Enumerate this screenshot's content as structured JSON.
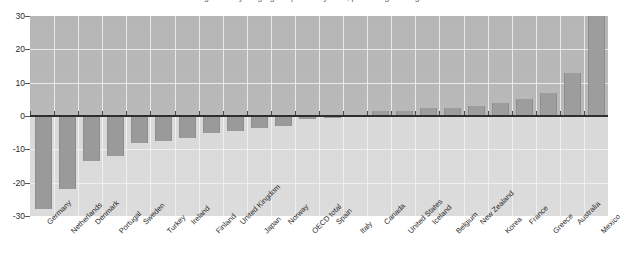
{
  "chart_data": {
    "type": "bar",
    "title": "Change in the young-age dependency ratio, percentage change",
    "xlabel": "",
    "ylabel": "",
    "ylim": [
      -30,
      30
    ],
    "yticks": [
      30,
      20,
      10,
      0,
      -10,
      -20,
      -30
    ],
    "ytick_labels": [
      "30",
      "20",
      "10",
      "0",
      "-10",
      "-20",
      "-30"
    ],
    "grid": true,
    "legend": "none",
    "series_name": "Percentage change",
    "bar_color": "#9a9a9a",
    "plot_background_above_zero": "#b8b8b8",
    "plot_background_below_zero": "#dadada",
    "categories": [
      "Germany",
      "Netherlands",
      "Denmark",
      "Portugal",
      "Sweden",
      "Turkey",
      "Ireland",
      "Finland",
      "United Kingdom",
      "Japan",
      "Norway",
      "OECD total",
      "Spain",
      "Italy",
      "Canada",
      "United States",
      "Iceland",
      "Belgium",
      "New Zealand",
      "Korea",
      "France",
      "Greece",
      "Australia",
      "Mexico"
    ],
    "values": [
      -28,
      -22,
      -13.5,
      -12,
      -8,
      -7.5,
      -6.5,
      -5,
      -4.5,
      -3.5,
      -3,
      -1,
      -0.5,
      -0.3,
      1.5,
      1.5,
      2.5,
      2.5,
      3,
      4,
      5,
      7,
      13,
      31
    ]
  }
}
